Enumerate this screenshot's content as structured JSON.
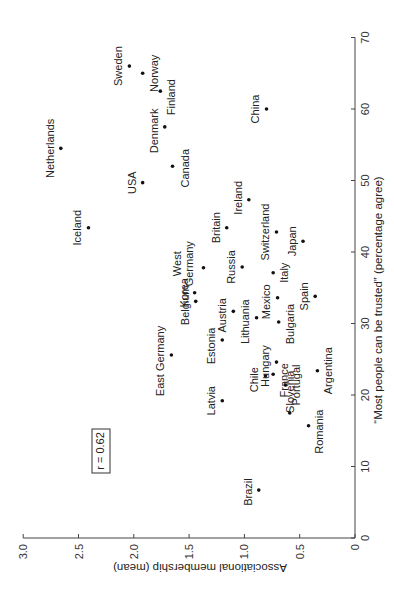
{
  "chart_data": {
    "type": "scatter",
    "orientation": "rotated 90 degrees clockwise",
    "title": "",
    "xlabel": "“Most people can be trusted” (percentage agree)",
    "ylabel": "Associational membership (mean)",
    "xlim": [
      0,
      70
    ],
    "ylim": [
      0,
      3.0
    ],
    "x_ticks": [
      "0",
      "10",
      "20",
      "30",
      "40",
      "50",
      "60",
      "70"
    ],
    "y_ticks": [
      "0",
      "0.5",
      "1.0",
      "1.5",
      "2.0",
      "2.5",
      "3.0"
    ],
    "grid": false,
    "annotation": "r = 0.62",
    "points": [
      {
        "label": "Sweden",
        "x": 66.0,
        "y": 2.04
      },
      {
        "label": "Norway",
        "x": 65.0,
        "y": 1.92
      },
      {
        "label": "Finland",
        "x": 62.5,
        "y": 1.76
      },
      {
        "label": "China",
        "x": 60.0,
        "y": 0.8
      },
      {
        "label": "Denmark",
        "x": 57.5,
        "y": 1.72
      },
      {
        "label": "Netherlands",
        "x": 54.5,
        "y": 2.66
      },
      {
        "label": "Canada",
        "x": 52.0,
        "y": 1.65
      },
      {
        "label": "USA",
        "x": 49.7,
        "y": 1.92
      },
      {
        "label": "Ireland",
        "x": 47.3,
        "y": 0.96
      },
      {
        "label": "Iceland",
        "x": 43.4,
        "y": 2.41
      },
      {
        "label": "Britain",
        "x": 43.4,
        "y": 1.16
      },
      {
        "label": "Switzerland",
        "x": 42.8,
        "y": 0.71
      },
      {
        "label": "Japan",
        "x": 41.5,
        "y": 0.47
      },
      {
        "label": "West Germany",
        "x": 37.8,
        "y": 1.37
      },
      {
        "label": "Russia",
        "x": 37.9,
        "y": 1.02
      },
      {
        "label": "Italy",
        "x": 37.1,
        "y": 0.74
      },
      {
        "label": "Korea",
        "x": 34.3,
        "y": 1.45
      },
      {
        "label": "Spain",
        "x": 33.8,
        "y": 0.36
      },
      {
        "label": "Mexico",
        "x": 33.6,
        "y": 0.7
      },
      {
        "label": "Belgium",
        "x": 33.1,
        "y": 1.44
      },
      {
        "label": "Austria",
        "x": 31.7,
        "y": 1.1
      },
      {
        "label": "Lithuania",
        "x": 30.8,
        "y": 0.89
      },
      {
        "label": "Bulgaria",
        "x": 30.2,
        "y": 0.69
      },
      {
        "label": "Estonia",
        "x": 27.7,
        "y": 1.2
      },
      {
        "label": "East Germany",
        "x": 25.6,
        "y": 1.66
      },
      {
        "label": "Hungary",
        "x": 24.6,
        "y": 0.71
      },
      {
        "label": "Argentina",
        "x": 23.4,
        "y": 0.34
      },
      {
        "label": "France",
        "x": 22.9,
        "y": 0.74
      },
      {
        "label": "Chile",
        "x": 22.7,
        "y": 0.81
      },
      {
        "label": "Portugal",
        "x": 21.4,
        "y": 0.63
      },
      {
        "label": "Latvia",
        "x": 19.2,
        "y": 1.2
      },
      {
        "label": "Slovenia",
        "x": 17.5,
        "y": 0.59
      },
      {
        "label": "Romania",
        "x": 15.7,
        "y": 0.42
      },
      {
        "label": "Brazil",
        "x": 6.7,
        "y": 0.87
      }
    ]
  }
}
